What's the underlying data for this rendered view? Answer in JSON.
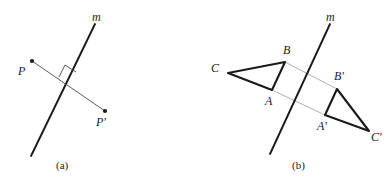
{
  "figure": {
    "background": "#ffffff",
    "ink": "#1a1a1a",
    "connector_color": "#9a9a9a",
    "panels": [
      {
        "id": "panel-a",
        "caption": "(a)",
        "caption_pos": {
          "x": 56,
          "y": 160
        },
        "mirror_line": {
          "label": "m",
          "label_pos": {
            "x": 92,
            "y": 11
          },
          "x1": 95,
          "y1": 24,
          "x2": 31,
          "y2": 156
        },
        "points": [
          {
            "name": "P",
            "label": "P",
            "x": 32,
            "y": 61,
            "label_x": 18,
            "label_y": 65
          },
          {
            "name": "P'",
            "label": "P'",
            "x": 105,
            "y": 111,
            "label_x": 96,
            "label_y": 116
          }
        ],
        "segment": {
          "x1": 32,
          "y1": 61,
          "x2": 105,
          "y2": 111
        },
        "right_angle_mark": {
          "cx": 67,
          "cy": 80,
          "size": 11
        }
      },
      {
        "id": "panel-b",
        "caption": "(b)",
        "caption_pos": {
          "x": 292,
          "y": 160
        },
        "mirror_line": {
          "label": "m",
          "label_pos": {
            "x": 326,
            "y": 11
          },
          "x1": 330,
          "y1": 24,
          "x2": 270,
          "y2": 154
        },
        "triangle": {
          "name": "triangle-abc",
          "vertices": [
            {
              "name": "A",
              "label": "A",
              "x": 272,
              "y": 90,
              "label_x": 265,
              "label_y": 95
            },
            {
              "name": "B",
              "label": "B",
              "x": 285,
              "y": 62,
              "label_x": 283,
              "label_y": 44
            },
            {
              "name": "C",
              "label": "C",
              "x": 228,
              "y": 73,
              "label_x": 211,
              "label_y": 62
            }
          ]
        },
        "triangle_image": {
          "name": "triangle-abc-prime",
          "vertices": [
            {
              "name": "A'",
              "label": "A'",
              "x": 325,
              "y": 115,
              "label_x": 317,
              "label_y": 120
            },
            {
              "name": "B'",
              "label": "B'",
              "x": 337,
              "y": 89,
              "label_x": 334,
              "label_y": 70
            },
            {
              "name": "C'",
              "label": "C'",
              "x": 369,
              "y": 131,
              "label_x": 371,
              "label_y": 131
            }
          ]
        },
        "connectors": [
          {
            "name": "connector-b-bprime",
            "x1": 285,
            "y1": 62,
            "x2": 337,
            "y2": 89
          },
          {
            "name": "connector-a-aprime",
            "x1": 272,
            "y1": 90,
            "x2": 325,
            "y2": 115
          }
        ]
      }
    ]
  }
}
